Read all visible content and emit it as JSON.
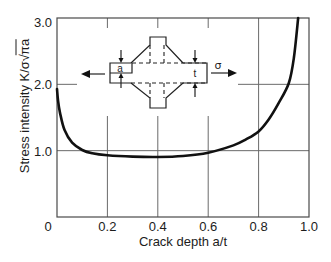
{
  "chart_data": {
    "type": "line",
    "title": "",
    "xlabel": "Crack depth a/t",
    "ylabel": "Stress intensity K/σ√πa",
    "ylabel_parts": {
      "main": "Stress intensity K/σ",
      "radical": "√",
      "radicand": "πa"
    },
    "xlim": [
      0,
      1.0
    ],
    "ylim": [
      0,
      3.0
    ],
    "xticks": [
      0,
      0.2,
      0.4,
      0.6,
      0.8,
      1.0
    ],
    "xtick_labels": [
      "0",
      "0.2",
      "0.4",
      "0.6",
      "0.8",
      "1.0"
    ],
    "yticks": [
      1.0,
      2.0,
      3.0
    ],
    "ytick_labels": [
      "1.0",
      "2.0",
      "3.0"
    ],
    "grid": true,
    "legend": null,
    "series": [
      {
        "name": "Stress intensity K/σ√πa",
        "x": [
          0.0,
          0.004,
          0.012,
          0.03,
          0.06,
          0.1,
          0.14,
          0.2,
          0.3,
          0.4,
          0.5,
          0.6,
          0.7,
          0.75,
          0.8,
          0.84,
          0.88,
          0.92,
          0.94,
          0.957
        ],
        "y": [
          1.93,
          1.76,
          1.57,
          1.31,
          1.12,
          1.01,
          0.96,
          0.93,
          0.91,
          0.905,
          0.92,
          0.97,
          1.08,
          1.17,
          1.29,
          1.47,
          1.72,
          2.02,
          2.4,
          3.0
        ]
      }
    ],
    "inset": {
      "description": "Cruciform welded joint with plate thickness t, crack depth a, loaded by remote stress σ",
      "labels": {
        "crack_depth": "a",
        "thickness": "t",
        "stress": "σ"
      }
    }
  }
}
